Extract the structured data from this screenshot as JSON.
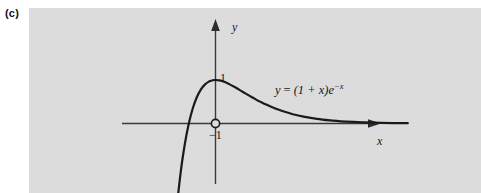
{
  "figure": {
    "part_label": "(c)",
    "background_color": "#ffffff",
    "panel_color": "#dcdcdc",
    "curve_color": "#1a1a1a",
    "axis_color": "#3a3a3a"
  },
  "chart_data": {
    "type": "line",
    "title": "",
    "subtitle": "",
    "xlabel": "x",
    "ylabel": "y",
    "equation": "y = (1 + x)e^{-x}",
    "equation_parts": {
      "lhs": "y",
      "equals": "=",
      "factor": "(1 + x)",
      "base": "e",
      "exponent": "−x"
    },
    "grid": false,
    "legend": "none",
    "annotations": [
      {
        "name": "y-axis-label",
        "text": "y"
      },
      {
        "name": "x-axis-label",
        "text": "x"
      },
      {
        "name": "peak-tick-label",
        "text": "1"
      },
      {
        "name": "x-intercept-label",
        "text": "−1"
      },
      {
        "name": "equation-label",
        "text": "y = (1 + x)e⁻ˣ"
      }
    ],
    "tick_labels": {
      "y": [
        "1"
      ],
      "x": [
        "−1"
      ]
    },
    "xlim": [
      -2.05,
      7.2
    ],
    "ylim": [
      -3.3,
      1.45
    ],
    "features": {
      "x_intercept": -1,
      "y_intercept": 1,
      "maximum": {
        "x": 0,
        "y": 1
      },
      "inflection": {
        "x": 1,
        "y": 0.7358
      },
      "asymptote": "y = 0 as x → +∞",
      "origin_marked": true
    },
    "x": [
      -2.05,
      -1.9,
      -1.75,
      -1.6,
      -1.45,
      -1.3,
      -1.15,
      -1.0,
      -0.85,
      -0.7,
      -0.55,
      -0.4,
      -0.25,
      -0.1,
      0.0,
      0.15,
      0.3,
      0.5,
      0.7,
      0.9,
      1.1,
      1.35,
      1.6,
      1.9,
      2.2,
      2.5,
      2.9,
      3.3,
      3.8,
      4.3,
      4.9,
      5.5,
      6.2,
      7.2
    ],
    "y": [
      -8.14,
      -6.02,
      -4.3,
      -2.97,
      -1.93,
      -1.1,
      -0.475,
      0.0,
      0.351,
      0.604,
      0.78,
      0.895,
      0.963,
      0.995,
      1.0,
      0.99,
      0.963,
      0.91,
      0.844,
      0.773,
      0.699,
      0.61,
      0.525,
      0.434,
      0.355,
      0.287,
      0.214,
      0.157,
      0.107,
      0.0717,
      0.0442,
      0.0268,
      0.0146,
      0.00609
    ],
    "series": [
      {
        "name": "y = (1 + x)e^{-x}",
        "x": [
          -2.05,
          -1.9,
          -1.75,
          -1.6,
          -1.45,
          -1.3,
          -1.15,
          -1.0,
          -0.85,
          -0.7,
          -0.55,
          -0.4,
          -0.25,
          -0.1,
          0.0,
          0.15,
          0.3,
          0.5,
          0.7,
          0.9,
          1.1,
          1.35,
          1.6,
          1.9,
          2.2,
          2.5,
          2.9,
          3.3,
          3.8,
          4.3,
          4.9,
          5.5,
          6.2,
          7.2
        ],
        "y": [
          -8.14,
          -6.02,
          -4.3,
          -2.97,
          -1.93,
          -1.1,
          -0.475,
          0.0,
          0.351,
          0.604,
          0.78,
          0.895,
          0.963,
          0.995,
          1.0,
          0.99,
          0.963,
          0.91,
          0.844,
          0.773,
          0.699,
          0.61,
          0.525,
          0.434,
          0.355,
          0.287,
          0.214,
          0.157,
          0.107,
          0.0717,
          0.0442,
          0.0268,
          0.0146,
          0.00609
        ]
      }
    ]
  }
}
